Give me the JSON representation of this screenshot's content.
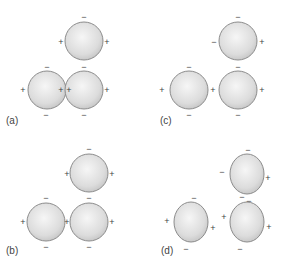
{
  "figure": {
    "colors": {
      "sphere_fill_center": "#f4f4f4",
      "sphere_fill_edge": "#c4c4c4",
      "sphere_stroke": "#8c8c8c",
      "sign_color": "#444444"
    },
    "panels": [
      {
        "label": "(a)",
        "label_pos": [
          6,
          124
        ],
        "spheres": [
          {
            "cx": 84,
            "cy": 41,
            "rx": 19,
            "ry": 19,
            "signs": [
              {
                "t": "−",
                "x": 84,
                "y": 17
              },
              {
                "t": "+",
                "x": 61,
                "y": 42
              },
              {
                "t": "+",
                "x": 107,
                "y": 42
              }
            ]
          },
          {
            "cx": 47,
            "cy": 90,
            "rx": 19,
            "ry": 19,
            "signs": [
              {
                "t": "−",
                "x": 47,
                "y": 67
              },
              {
                "t": "+",
                "x": 23,
                "y": 90
              },
              {
                "t": "+",
                "x": 61,
                "y": 90
              },
              {
                "t": "−",
                "x": 46,
                "y": 115
              }
            ]
          },
          {
            "cx": 84,
            "cy": 90,
            "rx": 19,
            "ry": 19,
            "signs": [
              {
                "t": "−",
                "x": 84,
                "y": 67
              },
              {
                "t": "+",
                "x": 69,
                "y": 90
              },
              {
                "t": "+",
                "x": 107,
                "y": 90
              },
              {
                "t": "−",
                "x": 84,
                "y": 115
              }
            ]
          }
        ]
      },
      {
        "label": "(c)",
        "label_pos": [
          160,
          124
        ],
        "spheres": [
          {
            "cx": 238,
            "cy": 41,
            "rx": 19,
            "ry": 19,
            "signs": [
              {
                "t": "−",
                "x": 238,
                "y": 17
              },
              {
                "t": "−",
                "x": 214,
                "y": 42
              },
              {
                "t": "+",
                "x": 262,
                "y": 42
              }
            ]
          },
          {
            "cx": 189,
            "cy": 90,
            "rx": 19,
            "ry": 19,
            "signs": [
              {
                "t": "−",
                "x": 189,
                "y": 67
              },
              {
                "t": "+",
                "x": 162,
                "y": 90
              },
              {
                "t": "+",
                "x": 213,
                "y": 90
              },
              {
                "t": "−",
                "x": 189,
                "y": 115
              }
            ]
          },
          {
            "cx": 238,
            "cy": 90,
            "rx": 19,
            "ry": 19,
            "signs": [
              {
                "t": "−",
                "x": 238,
                "y": 67
              },
              {
                "t": "+",
                "x": 262,
                "y": 90
              },
              {
                "t": "−",
                "x": 238,
                "y": 115
              }
            ]
          }
        ]
      },
      {
        "label": "(b)",
        "label_pos": [
          6,
          254
        ],
        "spheres": [
          {
            "cx": 89,
            "cy": 173,
            "rx": 19,
            "ry": 19,
            "signs": [
              {
                "t": "−",
                "x": 89,
                "y": 149
              },
              {
                "t": "+",
                "x": 67,
                "y": 174
              },
              {
                "t": "+",
                "x": 112,
                "y": 174
              }
            ]
          },
          {
            "cx": 46,
            "cy": 222,
            "rx": 19,
            "ry": 19,
            "signs": [
              {
                "t": "−",
                "x": 46,
                "y": 198
              },
              {
                "t": "+",
                "x": 23,
                "y": 222
              },
              {
                "t": "+",
                "x": 67,
                "y": 222
              },
              {
                "t": "−",
                "x": 46,
                "y": 247
              }
            ]
          },
          {
            "cx": 89,
            "cy": 222,
            "rx": 19,
            "ry": 19,
            "signs": [
              {
                "t": "−",
                "x": 89,
                "y": 198
              },
              {
                "t": "+",
                "x": 112,
                "y": 222
              },
              {
                "t": "−",
                "x": 89,
                "y": 247
              }
            ]
          }
        ]
      },
      {
        "label": "(d)",
        "label_pos": [
          161,
          254
        ],
        "spheres": [
          {
            "cx": 247,
            "cy": 174,
            "rx": 17,
            "ry": 20,
            "signs": [
              {
                "t": "−",
                "x": 248,
                "y": 150
              },
              {
                "t": "−",
                "x": 222,
                "y": 172
              },
              {
                "t": "+",
                "x": 268,
                "y": 178
              }
            ]
          },
          {
            "cx": 191,
            "cy": 222,
            "rx": 17,
            "ry": 20,
            "signs": [
              {
                "t": "−",
                "x": 194,
                "y": 198
              },
              {
                "t": "+",
                "x": 167,
                "y": 221
              },
              {
                "t": "+",
                "x": 213,
                "y": 228
              },
              {
                "t": "−",
                "x": 186,
                "y": 249
              }
            ]
          },
          {
            "cx": 247,
            "cy": 222,
            "rx": 17,
            "ry": 20,
            "signs": [
              {
                "t": "−",
                "x": 242,
                "y": 197
              },
              {
                "t": "−",
                "x": 249,
                "y": 201
              },
              {
                "t": "+",
                "x": 224,
                "y": 217
              },
              {
                "t": "+",
                "x": 269,
                "y": 227
              },
              {
                "t": "−",
                "x": 240,
                "y": 249
              }
            ]
          }
        ]
      }
    ]
  }
}
